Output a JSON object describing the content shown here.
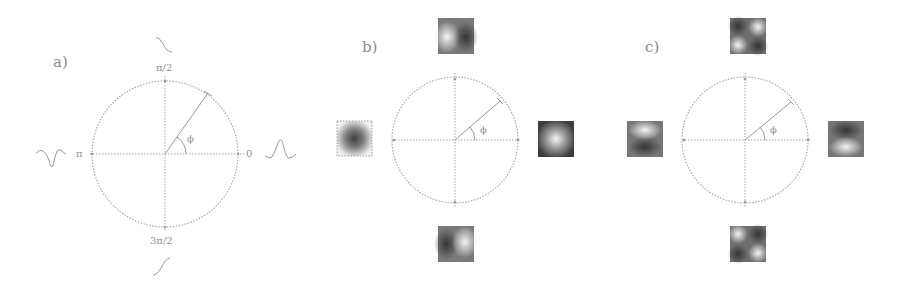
{
  "figure": {
    "panels": [
      {
        "id": "a",
        "label": "a)",
        "axis_labels": {
          "top": "π/2",
          "left": "π",
          "right": "0",
          "bottom": "3π/2"
        },
        "angle_label": "ϕ",
        "waveforms": {
          "left": "inverted-peak (dip)",
          "right": "peak",
          "top": "descending step",
          "bottom": "ascending step"
        }
      },
      {
        "id": "b",
        "label": "b)",
        "angle_label": "ϕ",
        "thumbnails": {
          "top": "bright-left / dark-right blob",
          "left": "dark center spot on light background",
          "right": "bright center spot on dark background",
          "bottom": "dark-left / bright-right blob"
        }
      },
      {
        "id": "c",
        "label": "c)",
        "angle_label": "ϕ",
        "thumbnails": {
          "top": "diagonal checker: bright top-right & bottom-left",
          "left": "bright top / dark bottom",
          "right": "dark top / bright bottom",
          "bottom": "diagonal checker: bright top-left & bottom-right"
        }
      }
    ],
    "colors": {
      "line": "#9a9a9a",
      "text": "#8a8a8a",
      "thumb_dark": "#4a4a4a",
      "thumb_light": "#f2f2f2"
    }
  }
}
